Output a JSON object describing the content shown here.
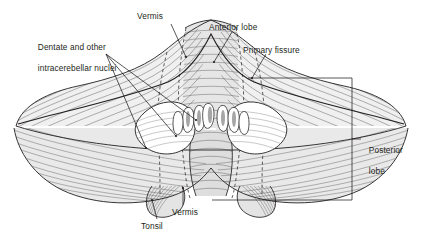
{
  "figure": {
    "name": "cerebellum-superior-view",
    "background": "#ffffff",
    "ink": "#231f20",
    "fill_light": "#f2f2f2",
    "fill_mid": "#e4e4e4",
    "fill_dark": "#d4d4d4",
    "nucleus_fill": "#ffffff"
  },
  "labels": {
    "dentate": {
      "line1": "Dentate and other",
      "line2": "intracerebellar nuclei",
      "x": 33,
      "y": 31
    },
    "vermis_top": {
      "text": "Vermis",
      "x": 137,
      "y": 11
    },
    "anterior_lobe": {
      "text": "Anterior lobe",
      "x": 209,
      "y": 22
    },
    "primary_fissure": {
      "text": "Primary fissure",
      "x": 243,
      "y": 45
    },
    "posterior_lobe": {
      "line1": "Posterior",
      "line2": "lobe",
      "x": 364,
      "y": 134
    },
    "vermis_bottom": {
      "text": "Vermis",
      "x": 172,
      "y": 207
    },
    "tonsil": {
      "text": "Tonsil",
      "x": 141,
      "y": 221
    }
  }
}
